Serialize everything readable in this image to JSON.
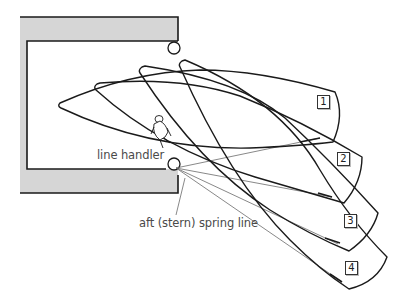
{
  "diagram": {
    "type": "boat-maneuver-sequence",
    "colors": {
      "dock_fill": "#d6d6d6",
      "dock_edge": "#1a1a1a",
      "hull_stroke": "#1a1a1a",
      "line_stroke": "#6a6a6a",
      "label_text": "#4a4a4a"
    },
    "labels": {
      "line_handler": "line handler",
      "spring_line": "aft (stern) spring line"
    },
    "positions": [
      {
        "id": 1,
        "label": "1"
      },
      {
        "id": 2,
        "label": "2"
      },
      {
        "id": 3,
        "label": "3"
      },
      {
        "id": 4,
        "label": "4"
      }
    ],
    "elements": {
      "dock": "L-shaped dock/pier",
      "bollards": [
        "upper bollard",
        "lower bollard"
      ],
      "figure": "line handler on boat"
    }
  }
}
